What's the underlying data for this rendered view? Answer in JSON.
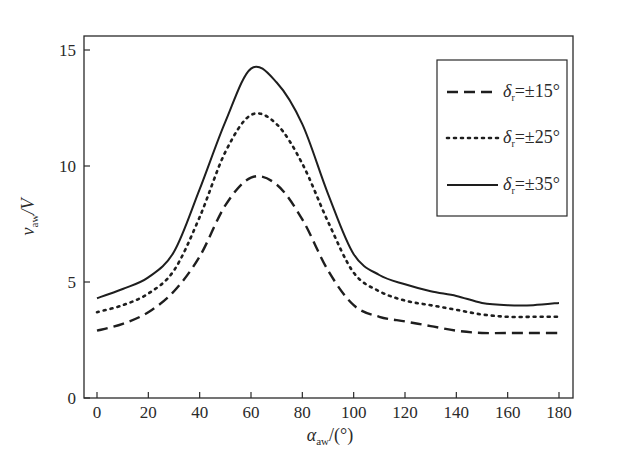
{
  "chart_data": {
    "type": "line",
    "title": "",
    "xlabel": {
      "symbol": "α",
      "subscript": "aw",
      "suffix": "/(°)"
    },
    "ylabel": {
      "symbol": "v",
      "subscript": "aw",
      "suffix": "/V"
    },
    "xlim": [
      -5,
      185
    ],
    "ylim": [
      0,
      16
    ],
    "x_ticks": [
      0,
      20,
      40,
      60,
      80,
      100,
      120,
      140,
      160,
      180
    ],
    "y_ticks": [
      0,
      5,
      10,
      15
    ],
    "grid": false,
    "legend_position": "top-right",
    "x": [
      0,
      10,
      20,
      30,
      40,
      50,
      60,
      70,
      80,
      90,
      100,
      110,
      120,
      130,
      140,
      150,
      160,
      170,
      180
    ],
    "series": [
      {
        "name": "δr=±15°",
        "legend": {
          "symbol": "δ",
          "subscript": "r",
          "value": "=±15°"
        },
        "style": "dashed",
        "values": [
          2.9,
          3.2,
          3.7,
          4.6,
          6.1,
          8.3,
          9.5,
          9.2,
          7.7,
          5.5,
          4.0,
          3.5,
          3.3,
          3.1,
          2.9,
          2.8,
          2.8,
          2.8,
          2.8
        ]
      },
      {
        "name": "δr=±25°",
        "legend": {
          "symbol": "δ",
          "subscript": "r",
          "value": "=±25°"
        },
        "style": "dotted",
        "values": [
          3.7,
          4.0,
          4.5,
          5.5,
          7.8,
          10.6,
          12.2,
          11.8,
          10.1,
          7.6,
          5.4,
          4.6,
          4.2,
          4.0,
          3.8,
          3.6,
          3.5,
          3.5,
          3.5
        ]
      },
      {
        "name": "δr=±35°",
        "legend": {
          "symbol": "δ",
          "subscript": "r",
          "value": "=±35°"
        },
        "style": "solid",
        "values": [
          4.3,
          4.7,
          5.2,
          6.3,
          9.0,
          11.9,
          14.2,
          13.6,
          11.8,
          8.8,
          6.2,
          5.3,
          4.9,
          4.6,
          4.4,
          4.1,
          4.0,
          4.0,
          4.1
        ]
      }
    ]
  }
}
